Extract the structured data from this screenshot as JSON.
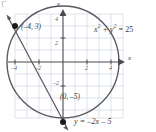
{
  "figure": {
    "background": "#ffffff",
    "grid_color": "#cfd8e3",
    "curve_color": "#58585e",
    "axis_color": "#4a4a50",
    "text_color": "#3a3a3a"
  },
  "axes": {
    "x_label": "x",
    "y_label": "y",
    "x_ticks": [
      {
        "value": -4,
        "label": "–4"
      },
      {
        "value": -2,
        "label": "–2"
      },
      {
        "value": 2,
        "label": "2"
      },
      {
        "value": 4,
        "label": "4"
      }
    ],
    "y_ticks": [
      {
        "value": 4,
        "label": "4"
      },
      {
        "value": 2,
        "label": "2"
      },
      {
        "value": -2,
        "label": "–2"
      }
    ],
    "x_range": [
      -6,
      6
    ],
    "y_range": [
      -6,
      6
    ],
    "grid": true
  },
  "curves": [
    {
      "name": "circle",
      "equation_parts": {
        "lead": "x",
        "sup1": "2",
        "mid": " + y",
        "sup2": "2",
        "tail": " = 25"
      },
      "equation_text": "x2 + y2 = 25",
      "center": [
        0,
        0
      ],
      "radius": 5
    },
    {
      "name": "line",
      "equation_text": "y = –2x – 5",
      "slope": -2,
      "intercept": -5
    }
  ],
  "points": [
    {
      "name": "intersection-upper-left",
      "label": "(–4, 3)",
      "x": -4,
      "y": 3
    },
    {
      "name": "intersection-lower",
      "label": "(0, –5)",
      "x": 0,
      "y": -5
    }
  ]
}
